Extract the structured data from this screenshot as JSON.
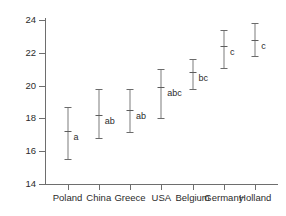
{
  "chart_data": {
    "type": "scatter",
    "title": "",
    "subtitle": "",
    "xlabel": "",
    "ylabel": "",
    "categories": [
      "Poland",
      "China",
      "Greece",
      "USA",
      "Belgium",
      "Germany",
      "Holland"
    ],
    "values": [
      17.25,
      18.2,
      18.5,
      19.9,
      20.8,
      22.4,
      22.8
    ],
    "error_lower": [
      15.5,
      16.8,
      17.2,
      18.0,
      19.8,
      21.1,
      21.8
    ],
    "error_upper": [
      18.7,
      19.8,
      19.8,
      21.0,
      21.6,
      23.4,
      23.8
    ],
    "group_letters": [
      "a",
      "ab",
      "ab",
      "abc",
      "bc",
      "c",
      "c"
    ],
    "ylim": [
      14,
      24
    ],
    "yticks": [
      14,
      16,
      18,
      20,
      22,
      24
    ],
    "ytick_labels": [
      "14",
      "16",
      "18",
      "20",
      "22",
      "24"
    ],
    "grid": false,
    "legend": "none",
    "marker_color": "#7d7d7d",
    "axis_color": "#6e6e6e",
    "text_color": "#2b2b2b",
    "background": "#ffffff"
  }
}
